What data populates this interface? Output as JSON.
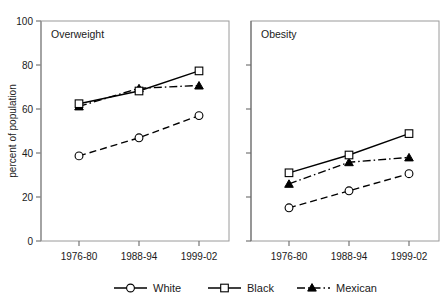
{
  "chart_data": {
    "type": "line",
    "title": "",
    "xlabel": "",
    "ylabel": "percent of population",
    "ylim": [
      0,
      100
    ],
    "yticks": [
      0,
      20,
      40,
      60,
      80,
      100
    ],
    "grid": false,
    "legend_position": "bottom",
    "categories": [
      "1976-80",
      "1988-94",
      "1999-02"
    ],
    "panels": [
      {
        "title": "Overweight",
        "series": [
          {
            "name": "White",
            "marker": "open-circle",
            "linestyle": "dashed",
            "values": [
              38.7,
              46.9,
              57.0
            ]
          },
          {
            "name": "Black",
            "marker": "open-square",
            "linestyle": "solid",
            "values": [
              62.4,
              68.2,
              77.3
            ]
          },
          {
            "name": "Mexican",
            "marker": "filled-triangle",
            "linestyle": "dash-dot",
            "values": [
              61.2,
              69.4,
              70.7
            ]
          }
        ]
      },
      {
        "title": "Obesity",
        "series": [
          {
            "name": "White",
            "marker": "open-circle",
            "linestyle": "dashed",
            "values": [
              15.1,
              22.8,
              30.6
            ]
          },
          {
            "name": "Black",
            "marker": "open-square",
            "linestyle": "solid",
            "values": [
              31.0,
              39.1,
              48.8
            ]
          },
          {
            "name": "Mexican",
            "marker": "filled-triangle",
            "linestyle": "dash-dot",
            "values": [
              26.0,
              35.8,
              38.0
            ]
          }
        ]
      }
    ],
    "legend": [
      {
        "label": "White",
        "marker": "open-circle",
        "linestyle": "solid"
      },
      {
        "label": "Black",
        "marker": "open-square",
        "linestyle": "solid"
      },
      {
        "label": "Mexican",
        "marker": "filled-triangle",
        "linestyle": "dash-dot"
      }
    ]
  },
  "axis": {
    "ylabel": "percent of population",
    "ytick_0": "0",
    "ytick_20": "20",
    "ytick_40": "40",
    "ytick_60": "60",
    "ytick_80": "80",
    "ytick_100": "100"
  },
  "panel_left": {
    "title": "Overweight",
    "xtick_1": "1976-80",
    "xtick_2": "1988-94",
    "xtick_3": "1999-02"
  },
  "panel_right": {
    "title": "Obesity",
    "xtick_1": "1976-80",
    "xtick_2": "1988-94",
    "xtick_3": "1999-02"
  },
  "legend": {
    "item_1": "White",
    "item_2": "Black",
    "item_3": "Mexican"
  }
}
